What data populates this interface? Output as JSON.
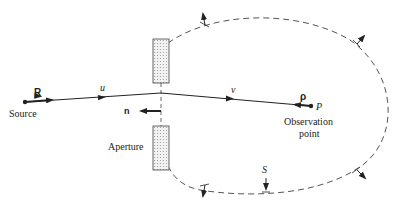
{
  "diagram": {
    "labels": {
      "source_vector": "R",
      "source": "Source",
      "u": "u",
      "n": "n",
      "aperture": "Aperture",
      "v": "v",
      "rho": "ρ",
      "p": "P",
      "observation_line1": "Observation",
      "observation_line2": "point",
      "surface": "S"
    },
    "colors": {
      "line": "#222222",
      "dashed_surface": "#555555",
      "aperture_fill": "#e4e4e4"
    }
  }
}
